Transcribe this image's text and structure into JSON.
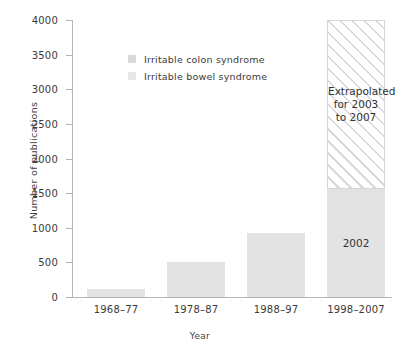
{
  "chart_data": {
    "type": "bar",
    "title": "",
    "xlabel": "Year",
    "ylabel": "Number of publications",
    "categories": [
      "1968–77",
      "1978–87",
      "1988–97",
      "1998–2007"
    ],
    "values": [
      110,
      500,
      920,
      4000
    ],
    "ylim": [
      0,
      4000
    ],
    "yticks": [
      0,
      500,
      1000,
      1500,
      2000,
      2500,
      3000,
      3500,
      4000
    ],
    "ytick_labels": [
      "0",
      "500",
      "1000",
      "1500",
      "2000",
      "2500",
      "3000",
      "3500",
      "4000"
    ],
    "grid": false,
    "legend_position": "upper-center",
    "series": [
      {
        "name": "Irritable colon syndrome",
        "swatch_color": "#d9d9d9",
        "values": [
          110,
          500,
          920,
          1560
        ]
      },
      {
        "name": "Irritable bowel syndrome",
        "swatch_color": "#e8e8e8",
        "values": [
          0,
          0,
          0,
          2440
        ]
      }
    ],
    "bar_segments": [
      {
        "category": "1968–77",
        "solid_value": 110,
        "hatched_value": 0,
        "solid_label": "",
        "hatched_label": ""
      },
      {
        "category": "1978–87",
        "solid_value": 500,
        "hatched_value": 0,
        "solid_label": "",
        "hatched_label": ""
      },
      {
        "category": "1988–97",
        "solid_value": 920,
        "hatched_value": 0,
        "solid_label": "",
        "hatched_label": ""
      },
      {
        "category": "1998–2007",
        "solid_value": 1560,
        "hatched_value": 2440,
        "solid_label": "2002",
        "hatched_label": "Extrapolated\nfor 2003\nto 2007"
      }
    ],
    "annotations": [
      {
        "text": "2002",
        "bar": "1998–2007",
        "region": "solid"
      },
      {
        "text": "Extrapolated for 2003 to 2007",
        "bar": "1998–2007",
        "region": "hatched"
      }
    ],
    "colors": {
      "bar_fill": "#e6e6e6",
      "solid_segment_fill": "#e3e3e3",
      "hatch_line": "#d8d8d8",
      "axis": "#b4b4b4",
      "text": "#3a3a3a"
    }
  },
  "legend": {
    "items": [
      {
        "label": "Irritable colon syndrome",
        "color": "#d9d9d9"
      },
      {
        "label": "Irritable bowel syndrome",
        "color": "#e8e8e8"
      }
    ]
  },
  "annotation_lines": {
    "extrapolated_line1": "Extrapolated",
    "extrapolated_line2": "for 2003",
    "extrapolated_line3": "to 2007",
    "solid_year": "2002"
  }
}
